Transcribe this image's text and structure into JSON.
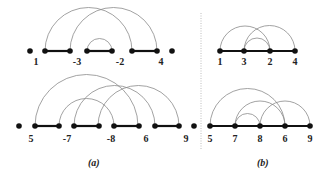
{
  "panels": {
    "a": {
      "caption": "(a)",
      "top": {
        "labels": [
          "1",
          "-3",
          "-2",
          "4"
        ],
        "label_x": [
          36,
          77,
          120,
          161
        ],
        "label_y": 65,
        "y": 51,
        "dots": [
          30,
          45,
          70,
          87,
          112,
          132,
          157,
          172
        ],
        "segments": [
          [
            45,
            70
          ],
          [
            87,
            112
          ],
          [
            132,
            157
          ]
        ],
        "arcs": [
          [
            45,
            132
          ],
          [
            70,
            157
          ],
          [
            87,
            112
          ]
        ]
      },
      "bottom": {
        "labels": [
          "5",
          "-7",
          "-8",
          "6",
          "9"
        ],
        "label_x": [
          31,
          67,
          111,
          146,
          186
        ],
        "label_y": 142,
        "y": 126,
        "dots": [
          19,
          35,
          59,
          74,
          99,
          114,
          139,
          155,
          179,
          194
        ],
        "segments": [
          [
            35,
            59
          ],
          [
            74,
            99
          ],
          [
            114,
            139
          ],
          [
            155,
            179
          ]
        ],
        "arcs": [
          [
            35,
            138
          ],
          [
            59,
            114
          ],
          [
            74,
            155
          ],
          [
            98,
            179
          ]
        ]
      }
    },
    "b": {
      "caption": "(b)",
      "top": {
        "labels": [
          "1",
          "3",
          "2",
          "4"
        ],
        "label_x": [
          220,
          244,
          270,
          295
        ],
        "label_y": 65,
        "y": 51,
        "dots": [
          220,
          244,
          270,
          295
        ],
        "segments": [
          [
            220,
            295
          ]
        ],
        "arcs": [
          [
            220,
            270
          ],
          [
            244,
            295
          ],
          [
            244,
            270
          ]
        ]
      },
      "bottom": {
        "labels": [
          "5",
          "7",
          "8",
          "6",
          "9"
        ],
        "label_x": [
          210,
          235,
          260,
          285,
          310
        ],
        "label_y": 142,
        "y": 126,
        "dots": [
          210,
          235,
          260,
          285,
          310
        ],
        "segments": [
          [
            210,
            310
          ]
        ],
        "arcs": [
          [
            210,
            285
          ],
          [
            235,
            285
          ],
          [
            235,
            260
          ],
          [
            260,
            310
          ]
        ]
      }
    }
  },
  "captions": {
    "a": "(a)",
    "b": "(b)"
  }
}
